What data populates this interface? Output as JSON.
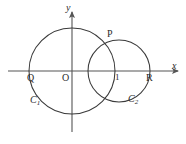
{
  "figure": {
    "background_color": "#ffffff",
    "stroke_color": "#3a3a3a",
    "axis_color": "#555555",
    "text_color": "#2b2b2b"
  },
  "axes": {
    "x_axis": {
      "label": "x",
      "label_style": "italic",
      "start_x": 8,
      "end_x": 178,
      "y": 71,
      "arrow": "right"
    },
    "y_axis": {
      "label": "y",
      "label_style": "italic",
      "x": 72,
      "start_y": 132,
      "end_y": 12,
      "arrow": "up"
    },
    "origin_label": "O",
    "tick_labels": [
      {
        "text": "1",
        "x": 118,
        "axis": "x"
      }
    ]
  },
  "circles": [
    {
      "name": "C1",
      "label": "C",
      "subscript": "1",
      "center_x": 72,
      "center_y": 71,
      "radius": 43
    },
    {
      "name": "C2",
      "label": "C",
      "subscript": "2",
      "center_x": 119,
      "center_y": 71,
      "radius": 31
    }
  ],
  "points": [
    {
      "label": "P",
      "x": 112,
      "y": 42,
      "description": "upper intersection of the two circles"
    },
    {
      "label": "Q",
      "x": 38,
      "y": 71,
      "description": "left x-axis crossing of circle C1"
    },
    {
      "label": "R",
      "x": 150,
      "y": 71,
      "description": "right x-axis crossing of circle C2"
    },
    {
      "label": "O",
      "x": 72,
      "y": 71,
      "description": "origin"
    }
  ],
  "label_positions": {
    "y_axis": {
      "x": 66,
      "y": 4
    },
    "x_axis": {
      "x": 172,
      "y": 62
    },
    "point_P": {
      "x": 108,
      "y": 30
    },
    "point_Q": {
      "x": 28,
      "y": 74
    },
    "origin_O": {
      "x": 62,
      "y": 74
    },
    "tick_one": {
      "x": 114,
      "y": 74
    },
    "point_R": {
      "x": 146,
      "y": 74
    },
    "curve_C1": {
      "x": 30,
      "y": 96
    },
    "curve_C2": {
      "x": 128,
      "y": 95
    }
  }
}
